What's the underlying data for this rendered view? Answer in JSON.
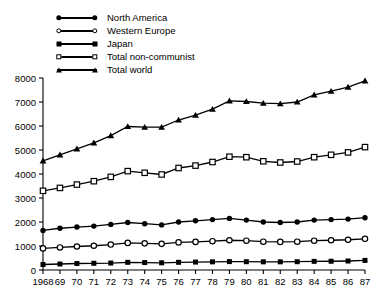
{
  "legend": {
    "position": "top-left",
    "items": [
      {
        "label": "North America",
        "marker": "filled-circle",
        "key": "north_america"
      },
      {
        "label": "Western Europe",
        "marker": "open-circle",
        "key": "western_europe"
      },
      {
        "label": "Japan",
        "marker": "filled-square",
        "key": "japan"
      },
      {
        "label": "Total non-communist",
        "marker": "open-square",
        "key": "total_non_communist"
      },
      {
        "label": "Total world",
        "marker": "filled-triangle",
        "key": "total_world"
      }
    ]
  },
  "chart_data": {
    "type": "line",
    "title": "",
    "xlabel": "",
    "ylabel": "",
    "grid": false,
    "legend_position": "top-left",
    "xlim": [
      1968,
      1987
    ],
    "ylim": [
      0,
      8000
    ],
    "ytick_values": [
      0,
      1000,
      2000,
      3000,
      4000,
      5000,
      6000,
      7000,
      8000
    ],
    "ytick_labels": [
      "0",
      "1000",
      "2000",
      "3000",
      "4000",
      "5000",
      "6000",
      "7000",
      "8000"
    ],
    "x": [
      1968,
      1969,
      1970,
      1971,
      1972,
      1973,
      1974,
      1975,
      1976,
      1977,
      1978,
      1979,
      1980,
      1981,
      1982,
      1983,
      1984,
      1985,
      1986,
      1987
    ],
    "xtick_labels": [
      "1968",
      "69",
      "70",
      "71",
      "72",
      "73",
      "74",
      "75",
      "76",
      "77",
      "78",
      "79",
      "80",
      "81",
      "82",
      "83",
      "84",
      "85",
      "86",
      "87"
    ],
    "series": [
      {
        "name": "Total world",
        "marker": "filled-triangle",
        "color": "#000000",
        "values": [
          4550,
          4800,
          5050,
          5300,
          5600,
          5980,
          5950,
          5950,
          6250,
          6450,
          6700,
          7050,
          7020,
          6950,
          6930,
          7000,
          7300,
          7450,
          7620,
          7880
        ]
      },
      {
        "name": "Total non-communist",
        "marker": "open-square",
        "color": "#000000",
        "values": [
          3300,
          3420,
          3560,
          3700,
          3880,
          4120,
          4050,
          3980,
          4250,
          4350,
          4500,
          4720,
          4700,
          4530,
          4480,
          4520,
          4700,
          4800,
          4900,
          5120
        ]
      },
      {
        "name": "North America",
        "marker": "filled-circle",
        "color": "#000000",
        "values": [
          1650,
          1740,
          1790,
          1830,
          1900,
          1980,
          1930,
          1880,
          2000,
          2050,
          2100,
          2150,
          2080,
          2000,
          1980,
          2000,
          2080,
          2100,
          2120,
          2180
        ]
      },
      {
        "name": "Western Europe",
        "marker": "open-circle",
        "color": "#000000",
        "values": [
          900,
          940,
          980,
          1010,
          1060,
          1130,
          1110,
          1090,
          1150,
          1170,
          1200,
          1240,
          1220,
          1180,
          1170,
          1180,
          1220,
          1240,
          1260,
          1300
        ]
      },
      {
        "name": "Japan",
        "marker": "filled-square",
        "color": "#000000",
        "values": [
          230,
          250,
          270,
          280,
          290,
          320,
          310,
          300,
          320,
          330,
          340,
          350,
          345,
          340,
          340,
          345,
          360,
          365,
          375,
          400
        ]
      }
    ]
  }
}
